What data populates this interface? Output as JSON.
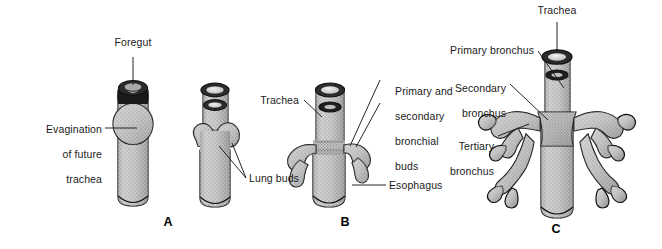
{
  "figure": {
    "background_color": "#ffffff",
    "ink_color": "#1a1a1a",
    "tissue_fill": "#c9c9c9",
    "tissue_shadow": "#8a8a8a",
    "lumen_fill": "#dddddd",
    "width": 662,
    "height": 249
  },
  "panels": [
    {
      "letter": "A",
      "letter_x": 168,
      "letter_y": 222,
      "caption": "Evagination of the future trachea from the foregut and formation of the paired lung buds",
      "figures": [
        "foregut-with-evagination",
        "foregut-with-lung-buds"
      ]
    },
    {
      "letter": "B",
      "letter_x": 345,
      "letter_y": 222,
      "caption": "Trachea separated from the esophagus with primary and secondary bronchial buds",
      "figures": [
        "trachea-with-bronchial-buds"
      ]
    },
    {
      "letter": "C",
      "letter_x": 556,
      "letter_y": 228,
      "caption": "Mature bronchial tree with primary, secondary and tertiary bronchi",
      "figures": [
        "bronchial-tree"
      ]
    }
  ],
  "labels": [
    {
      "id": "foregut",
      "text": "Foregut",
      "panel": "A",
      "align": "center",
      "x": 101,
      "y": 42,
      "width": 64,
      "leader": {
        "type": "line",
        "points": [
          [
            133,
            57
          ],
          [
            133,
            85
          ]
        ]
      }
    },
    {
      "id": "evagination-of-future-trachea",
      "text": "Evagination\nof future\ntrachea",
      "lines": [
        "Evagination",
        "of future",
        "trachea"
      ],
      "panel": "A",
      "align": "right",
      "x": 20,
      "y": 110,
      "width": 82,
      "leader": {
        "type": "line",
        "points": [
          [
            105,
            128
          ],
          [
            137,
            128
          ]
        ]
      }
    },
    {
      "id": "lung-buds",
      "text": "Lung buds",
      "panel": "A",
      "align": "left",
      "x": 248,
      "y": 175,
      "width": 60,
      "leader": {
        "type": "multi",
        "points": [
          [
            [
              246,
              178
            ],
            [
              219,
              146
            ]
          ],
          [
            [
              246,
              178
            ],
            [
              232,
              143
            ]
          ]
        ]
      }
    },
    {
      "id": "trachea-b",
      "text": "Trachea",
      "panel": "B",
      "align": "right",
      "x": 252,
      "y": 96,
      "width": 47,
      "leader": {
        "type": "line",
        "points": [
          [
            304,
            100
          ],
          [
            322,
            115
          ]
        ]
      }
    },
    {
      "id": "primary-and-secondary-bronchial-buds",
      "text": "Primary and\nsecondary\nbronchial\nbuds",
      "lines": [
        "Primary and",
        "secondary",
        "bronchial",
        "buds"
      ],
      "panel": "B",
      "align": "left",
      "x": 382,
      "y": 72,
      "width": 72,
      "leader": {
        "type": "multi",
        "points": [
          [
            [
              380,
              80
            ],
            [
              350,
              145
            ]
          ],
          [
            [
              380,
              104
            ],
            [
              355,
              146
            ]
          ]
        ]
      }
    },
    {
      "id": "esophagus",
      "text": "Esophagus",
      "panel": "B",
      "align": "left",
      "x": 388,
      "y": 180,
      "width": 63,
      "leader": {
        "type": "line",
        "points": [
          [
            386,
            185
          ],
          [
            355,
            185
          ]
        ]
      }
    },
    {
      "id": "trachea-c",
      "text": "Trachea",
      "panel": "C",
      "align": "center",
      "x": 531,
      "y": 7,
      "width": 52,
      "leader": {
        "type": "line",
        "points": [
          [
            557,
            22
          ],
          [
            557,
            53
          ]
        ]
      }
    },
    {
      "id": "primary-bronchus",
      "text": "Primary bronchus",
      "panel": "C",
      "align": "right",
      "x": 436,
      "y": 46,
      "width": 98,
      "leader": {
        "type": "line",
        "points": [
          [
            538,
            51
          ],
          [
            563,
            85
          ]
        ]
      }
    },
    {
      "id": "secondary-bronchus",
      "text": "Secondary\nbronchus",
      "lines": [
        "Secondary",
        "bronchus"
      ],
      "panel": "C",
      "align": "right",
      "x": 443,
      "y": 72,
      "width": 63,
      "leader": {
        "type": "line",
        "points": [
          [
            510,
            84
          ],
          [
            548,
            120
          ]
        ]
      }
    },
    {
      "id": "tertiary-bronchus",
      "text": "Tertiary\nbronchus",
      "lines": [
        "Tertiary",
        "bronchus"
      ],
      "panel": "C",
      "align": "right",
      "x": 441,
      "y": 130,
      "width": 53,
      "leader": {
        "type": "line",
        "points": [
          [
            498,
            136
          ],
          [
            528,
            123
          ]
        ]
      }
    }
  ],
  "anatomy_terms": [
    "Foregut",
    "Evagination of future trachea",
    "Lung buds",
    "Trachea",
    "Primary and secondary bronchial buds",
    "Esophagus",
    "Primary bronchus",
    "Secondary bronchus",
    "Tertiary bronchus"
  ]
}
